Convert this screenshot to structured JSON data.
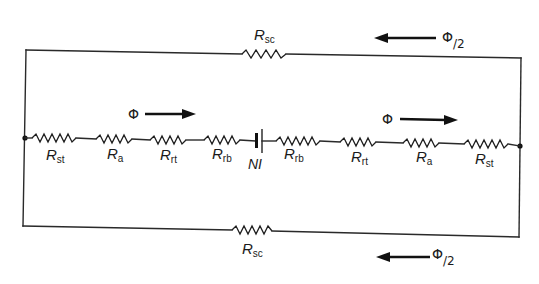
{
  "diagram": {
    "colors": {
      "line": "#2a2a2a",
      "background": "#ffffff"
    },
    "top_branch": {
      "resistor": {
        "label_main": "R",
        "label_sub": "sc"
      },
      "flux": {
        "symbol": "Φ",
        "fraction": "/2",
        "direction": "left"
      }
    },
    "middle_branch": {
      "left_resistors": [
        {
          "label_main": "R",
          "label_sub": "st"
        },
        {
          "label_main": "R",
          "label_sub": "a"
        },
        {
          "label_main": "R",
          "label_sub": "rt"
        },
        {
          "label_main": "R",
          "label_sub": "rb"
        }
      ],
      "source": {
        "label": "NI"
      },
      "right_resistors": [
        {
          "label_main": "R",
          "label_sub": "rb"
        },
        {
          "label_main": "R",
          "label_sub": "rt"
        },
        {
          "label_main": "R",
          "label_sub": "a"
        },
        {
          "label_main": "R",
          "label_sub": "st"
        }
      ],
      "flux_left": {
        "symbol": "Φ",
        "direction": "right"
      },
      "flux_right": {
        "symbol": "Φ",
        "direction": "right"
      }
    },
    "bottom_branch": {
      "resistor": {
        "label_main": "R",
        "label_sub": "sc"
      },
      "flux": {
        "symbol": "Φ",
        "fraction": "/2",
        "direction": "left"
      }
    }
  }
}
